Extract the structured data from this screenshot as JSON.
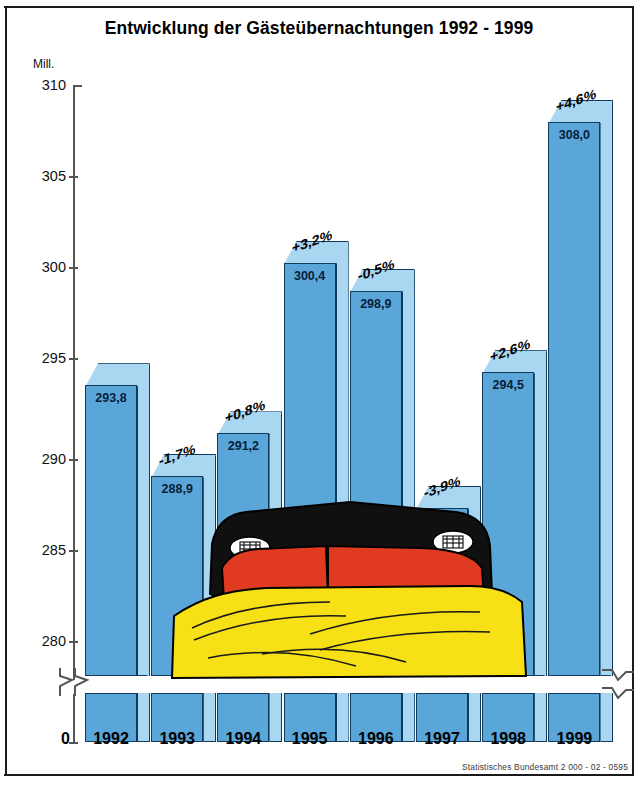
{
  "title": "Entwicklung der Gästeübernachtungen 1992 - 1999",
  "unit_label": "Mill.",
  "zero_label": "0",
  "source": "Statistisches Bundesamt 2 000 - 02 - 0595",
  "axis": {
    "ticks": [
      "310",
      "305",
      "300",
      "295",
      "290",
      "285",
      "280"
    ],
    "has_break": true
  },
  "colors": {
    "bar_front": "#5aa6d8",
    "bar_side": "#a9d6f0",
    "bar_outline": "#123a5c",
    "pillow_black": "#101010",
    "pillow_red": "#e03a20",
    "duvet_yellow": "#f7e016",
    "background": "#ffffff"
  },
  "chart_data": {
    "type": "bar",
    "title": "Entwicklung der Gästeübernachtungen 1992 - 1999",
    "xlabel": "",
    "ylabel": "Mill.",
    "ylim": [
      280,
      310
    ],
    "axis_break": true,
    "grid": false,
    "legend": "none",
    "categories": [
      "1992",
      "1993",
      "1994",
      "1995",
      "1996",
      "1997",
      "1998",
      "1999"
    ],
    "values": [
      293.8,
      288.9,
      291.2,
      300.4,
      298.9,
      287.2,
      294.5,
      308.0
    ],
    "value_labels": [
      "293,8",
      "288,9",
      "291,2",
      "300,4",
      "298,9",
      "287,2",
      "294,5",
      "308,0"
    ],
    "change_labels": [
      "",
      "-1,7%",
      "+0,8%",
      "+3,2%",
      "-0,5%",
      "-3,9%",
      "+2,6%",
      "+4,6%"
    ],
    "annotation": "Illustration of a bed in German national colours (black, red, gold) overlaid on the bars"
  }
}
